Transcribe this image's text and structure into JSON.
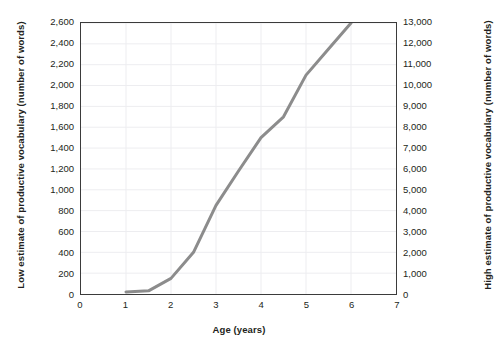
{
  "chart_data": {
    "type": "line",
    "title": "",
    "xlabel": "Age (years)",
    "ylabel": "Low estimate of productive vocabulary (number of words)",
    "y2label": "High estimate of productive vocabulary (number of words)",
    "xlim": [
      0,
      7
    ],
    "ylim": [
      0,
      2600
    ],
    "y2lim": [
      0,
      13000
    ],
    "grid": true,
    "legend": "none",
    "xticks": [
      "0",
      "1",
      "2",
      "3",
      "4",
      "5",
      "6",
      "7"
    ],
    "xtick_values": [
      0,
      1,
      2,
      3,
      4,
      5,
      6,
      7
    ],
    "yticks": [
      "0",
      "200",
      "400",
      "600",
      "800",
      "1,000",
      "1,200",
      "1,400",
      "1,600",
      "1,800",
      "2,000",
      "2,200",
      "2,400",
      "2,600"
    ],
    "ytick_values": [
      0,
      200,
      400,
      600,
      800,
      1000,
      1200,
      1400,
      1600,
      1800,
      2000,
      2200,
      2400,
      2600
    ],
    "y2ticks": [
      "0",
      "1,000",
      "2,000",
      "3,000",
      "4,000",
      "5,000",
      "6,000",
      "7,000",
      "8,000",
      "9,000",
      "10,000",
      "11,000",
      "12,000",
      "13,000"
    ],
    "y2tick_values": [
      0,
      1000,
      2000,
      3000,
      4000,
      5000,
      6000,
      7000,
      8000,
      9000,
      10000,
      11000,
      12000,
      13000
    ],
    "series": [
      {
        "name": "productive vocabulary growth",
        "color": "#8c8c8c",
        "x": [
          1.0,
          1.5,
          2.0,
          2.5,
          3.0,
          3.5,
          4.0,
          4.5,
          5.0,
          5.5,
          6.0
        ],
        "values": [
          20,
          30,
          150,
          400,
          850,
          1180,
          1500,
          1700,
          2100,
          2350,
          2600
        ]
      }
    ]
  },
  "style": {
    "line_color": "#8c8c8c",
    "frame_color": "#3b3b3b",
    "grid_color": "#ededf0",
    "text_color": "#231f20",
    "background": "#ffffff"
  }
}
